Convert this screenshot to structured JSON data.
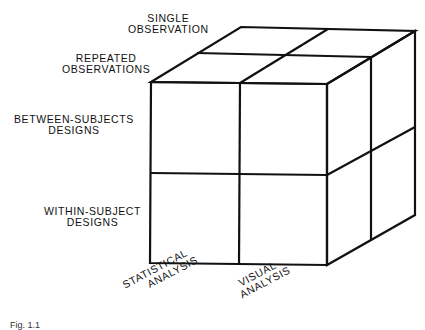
{
  "diagram": {
    "type": "3d-cube-2x2x2",
    "depth_axis": {
      "labels": [
        {
          "line1": "SINGLE",
          "line2": "OBSERVATION"
        },
        {
          "line1": "REPEATED",
          "line2": "OBSERVATIONS"
        }
      ]
    },
    "vertical_axis": {
      "labels": [
        {
          "line1": "BETWEEN-SUBJECTS",
          "line2": "DESIGNS"
        },
        {
          "line1": "WITHIN-SUBJECT",
          "line2": "DESIGNS"
        }
      ]
    },
    "horizontal_axis": {
      "labels": [
        {
          "line1": "STATISTICAL",
          "line2": "ANALYSIS"
        },
        {
          "line1": "VISUAL",
          "line2": "ANALYSIS"
        }
      ]
    },
    "caption": "Fig. 1.1"
  }
}
